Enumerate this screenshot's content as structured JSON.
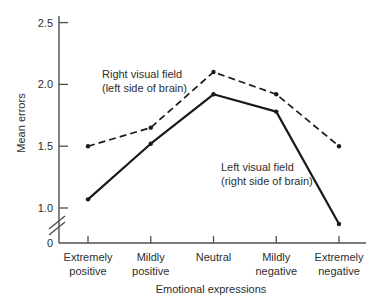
{
  "colors": {
    "line": "#1a1a1a",
    "axis": "#4f4f4f",
    "text": "#2e2e2e",
    "background": "#ffffff"
  },
  "chart_data": {
    "type": "line",
    "title": "",
    "xlabel": "Emotional expressions",
    "ylabel": "Mean errors",
    "categories": [
      "Extremely positive",
      "Mildly positive",
      "Neutral",
      "Mildly negative",
      "Extremely negative"
    ],
    "series": [
      {
        "name": "Right visual field (left side of brain)",
        "annotation": "Right visual field\n(left side of brain)",
        "style": "dashed",
        "values": [
          1.5,
          1.65,
          2.1,
          1.92,
          1.5
        ]
      },
      {
        "name": "Left visual field (right side of brain)",
        "annotation": "Left visual field\n(right side of brain)",
        "style": "solid",
        "values": [
          1.07,
          1.52,
          1.92,
          1.78,
          0.87
        ]
      }
    ],
    "yticks": [
      {
        "label": "2.5",
        "value": 2.5
      },
      {
        "label": "2.0",
        "value": 2.0
      },
      {
        "label": "1.5",
        "value": 1.5
      },
      {
        "label": "1.0",
        "value": 1.0
      },
      {
        "label": "0",
        "value": 0
      }
    ],
    "ylim": [
      0,
      2.5
    ],
    "y_axis_break": true,
    "grid": false,
    "legend_position": "inline-annotations"
  }
}
